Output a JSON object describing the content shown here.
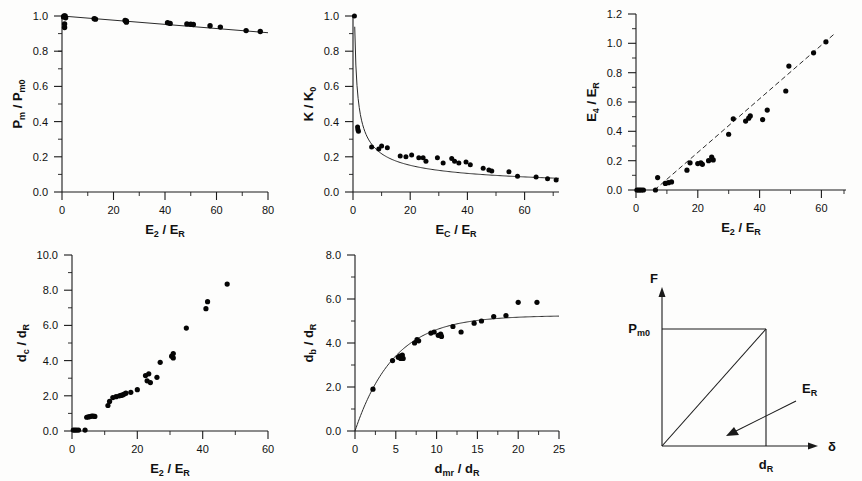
{
  "figure": {
    "title": "",
    "panel_count": 6,
    "background_color": "#fdfdfc",
    "ink_color": "#111111"
  },
  "chart_data": [
    {
      "id": "panel-a",
      "type": "scatter",
      "title": "",
      "xlabel": "E2 / ER",
      "ylabel": "Pm / Pm0",
      "xlabel_parts": {
        "main1": "E",
        "sub1": "2",
        "slash": " / ",
        "main2": "E",
        "sub2": "R"
      },
      "ylabel_parts": {
        "main1": "P",
        "sub1": "m",
        "slash": " / ",
        "main2": "P",
        "sub2": "m0"
      },
      "xlim": [
        0,
        80
      ],
      "ylim": [
        0.0,
        1.0
      ],
      "xticks": [
        0,
        20,
        40,
        60,
        80
      ],
      "xticklabels": [
        "0",
        "20",
        "40",
        "60",
        "80"
      ],
      "yticks": [
        0.0,
        0.2,
        0.4,
        0.6,
        0.8,
        1.0
      ],
      "yticklabels": [
        "0.0",
        "0.2",
        "0.4",
        "0.6",
        "0.8",
        "1.0"
      ],
      "grid": false,
      "legend": "none",
      "fit": {
        "kind": "line",
        "x": [
          0,
          80
        ],
        "y": [
          1.0,
          0.905
        ]
      },
      "points": [
        [
          0.6,
          0.995
        ],
        [
          0.8,
          1.0
        ],
        [
          1.2,
          1.0
        ],
        [
          1.4,
          0.99
        ],
        [
          1.0,
          0.955
        ],
        [
          1.0,
          0.935
        ],
        [
          12.5,
          0.985
        ],
        [
          13.0,
          0.982
        ],
        [
          24.5,
          0.975
        ],
        [
          25.0,
          0.972
        ],
        [
          25.0,
          0.965
        ],
        [
          41.0,
          0.962
        ],
        [
          42.0,
          0.958
        ],
        [
          48.5,
          0.955
        ],
        [
          50.0,
          0.953
        ],
        [
          51.0,
          0.952
        ],
        [
          57.5,
          0.945
        ],
        [
          61.5,
          0.937
        ],
        [
          71.5,
          0.917
        ],
        [
          77.0,
          0.912
        ]
      ]
    },
    {
      "id": "panel-b",
      "type": "scatter",
      "title": "",
      "xlabel": "EC / ER",
      "ylabel": "K / K0",
      "xlabel_parts": {
        "main1": "E",
        "sub1": "C",
        "slash": " / ",
        "main2": "E",
        "sub2": "R"
      },
      "ylabel_parts": {
        "main1": "K",
        "sub1": "",
        "slash": " / ",
        "main2": "K",
        "sub2": "0"
      },
      "xlim": [
        0,
        72
      ],
      "ylim": [
        0.0,
        1.0
      ],
      "xticks": [
        0,
        20,
        40,
        60
      ],
      "xticklabels": [
        "0",
        "20",
        "40",
        "60"
      ],
      "yticks": [
        0.0,
        0.2,
        0.4,
        0.6,
        0.8,
        1.0
      ],
      "yticklabels": [
        "0.0",
        "0.2",
        "0.4",
        "0.6",
        "0.8",
        "1.0"
      ],
      "grid": false,
      "legend": "none",
      "fit": {
        "kind": "power-decay",
        "amplitude": 0.72,
        "exponent": 0.52,
        "x0": 0.6,
        "xrange": [
          0.6,
          72
        ]
      },
      "points": [
        [
          0.5,
          1.0
        ],
        [
          1.6,
          0.37
        ],
        [
          1.7,
          0.355
        ],
        [
          1.9,
          0.345
        ],
        [
          6.5,
          0.255
        ],
        [
          9.0,
          0.245
        ],
        [
          10.0,
          0.262
        ],
        [
          12.0,
          0.252
        ],
        [
          16.5,
          0.205
        ],
        [
          18.5,
          0.2
        ],
        [
          20.5,
          0.21
        ],
        [
          23.0,
          0.195
        ],
        [
          24.5,
          0.195
        ],
        [
          25.5,
          0.175
        ],
        [
          29.5,
          0.195
        ],
        [
          31.5,
          0.165
        ],
        [
          34.5,
          0.19
        ],
        [
          35.5,
          0.175
        ],
        [
          37.0,
          0.165
        ],
        [
          39.5,
          0.17
        ],
        [
          41.0,
          0.155
        ],
        [
          45.5,
          0.135
        ],
        [
          47.5,
          0.125
        ],
        [
          48.5,
          0.12
        ],
        [
          54.5,
          0.115
        ],
        [
          57.5,
          0.09
        ],
        [
          64.0,
          0.085
        ],
        [
          68.0,
          0.075
        ],
        [
          71.0,
          0.068
        ]
      ]
    },
    {
      "id": "panel-c",
      "type": "scatter",
      "title": "",
      "xlabel": "E2 / ER",
      "ylabel": "E4 / ER",
      "xlabel_parts": {
        "main1": "E",
        "sub1": "2",
        "slash": " / ",
        "main2": "E",
        "sub2": "R"
      },
      "ylabel_parts": {
        "main1": "E",
        "sub1": "4",
        "slash": " / ",
        "main2": "E",
        "sub2": "R"
      },
      "xlim": [
        0,
        68
      ],
      "ylim": [
        0.0,
        1.2
      ],
      "xticks": [
        0,
        20,
        40,
        60
      ],
      "xticklabels": [
        "0",
        "20",
        "40",
        "60"
      ],
      "yticks": [
        0.0,
        0.2,
        0.4,
        0.6,
        0.8,
        1.0,
        1.2
      ],
      "yticklabels": [
        "0.0",
        "0.2",
        "0.4",
        "0.6",
        "0.8",
        "1.0",
        "1.2"
      ],
      "grid": false,
      "legend": "none",
      "fit": {
        "kind": "line",
        "x": [
          6.0,
          64.0
        ],
        "y": [
          0.0,
          1.06
        ]
      },
      "points": [
        [
          0.3,
          0.0
        ],
        [
          0.8,
          0.0
        ],
        [
          1.3,
          0.0
        ],
        [
          1.8,
          0.0
        ],
        [
          2.4,
          0.0
        ],
        [
          6.3,
          0.0
        ],
        [
          7.0,
          0.085
        ],
        [
          9.5,
          0.045
        ],
        [
          10.5,
          0.05
        ],
        [
          11.5,
          0.055
        ],
        [
          16.5,
          0.135
        ],
        [
          17.5,
          0.185
        ],
        [
          20.0,
          0.18
        ],
        [
          21.0,
          0.185
        ],
        [
          21.5,
          0.175
        ],
        [
          23.5,
          0.2
        ],
        [
          24.5,
          0.225
        ],
        [
          25.0,
          0.205
        ],
        [
          30.0,
          0.38
        ],
        [
          31.5,
          0.485
        ],
        [
          35.5,
          0.47
        ],
        [
          36.5,
          0.49
        ],
        [
          37.0,
          0.505
        ],
        [
          41.0,
          0.48
        ],
        [
          42.5,
          0.545
        ],
        [
          48.5,
          0.675
        ],
        [
          49.5,
          0.845
        ],
        [
          57.5,
          0.935
        ],
        [
          61.5,
          1.01
        ]
      ]
    },
    {
      "id": "panel-d",
      "type": "scatter",
      "title": "",
      "xlabel": "E2 / ER",
      "ylabel": "dc / dR",
      "xlabel_parts": {
        "main1": "E",
        "sub1": "2",
        "slash": " / ",
        "main2": "E",
        "sub2": "R"
      },
      "ylabel_parts": {
        "main1": "d",
        "sub1": "c",
        "slash": " / ",
        "main2": "d",
        "sub2": "R"
      },
      "xlim": [
        0,
        60
      ],
      "ylim": [
        0.0,
        10.0
      ],
      "xticks": [
        0,
        20,
        40,
        60
      ],
      "xticklabels": [
        "0",
        "20",
        "40",
        "60"
      ],
      "yticks": [
        0.0,
        2.0,
        4.0,
        6.0,
        8.0,
        10.0
      ],
      "yticklabels": [
        "0.0",
        "2.0",
        "4.0",
        "6.0",
        "8.0",
        "10.0"
      ],
      "grid": false,
      "legend": "none",
      "fit": {
        "kind": "none"
      },
      "points": [
        [
          0.4,
          0.05
        ],
        [
          0.9,
          0.05
        ],
        [
          1.4,
          0.05
        ],
        [
          2.0,
          0.05
        ],
        [
          4.0,
          0.05
        ],
        [
          4.5,
          0.78
        ],
        [
          5.0,
          0.8
        ],
        [
          5.5,
          0.82
        ],
        [
          6.0,
          0.85
        ],
        [
          6.5,
          0.85
        ],
        [
          7.0,
          0.83
        ],
        [
          11.0,
          1.45
        ],
        [
          11.5,
          1.68
        ],
        [
          12.5,
          1.9
        ],
        [
          13.5,
          1.95
        ],
        [
          14.5,
          2.0
        ],
        [
          15.0,
          2.02
        ],
        [
          15.5,
          2.05
        ],
        [
          16.0,
          2.1
        ],
        [
          16.5,
          2.15
        ],
        [
          18.0,
          2.2
        ],
        [
          20.0,
          2.35
        ],
        [
          22.5,
          3.15
        ],
        [
          23.5,
          3.25
        ],
        [
          23.0,
          2.85
        ],
        [
          24.0,
          2.75
        ],
        [
          26.0,
          3.05
        ],
        [
          27.0,
          3.9
        ],
        [
          30.5,
          4.25
        ],
        [
          31.0,
          4.4
        ],
        [
          31.0,
          4.15
        ],
        [
          35.0,
          5.85
        ],
        [
          41.0,
          6.95
        ],
        [
          41.5,
          7.35
        ],
        [
          47.5,
          8.35
        ]
      ]
    },
    {
      "id": "panel-e",
      "type": "scatter",
      "title": "",
      "xlabel": "dmr / dR",
      "ylabel": "db / dR",
      "xlabel_parts": {
        "main1": "d",
        "sub1": "mr",
        "slash": " / ",
        "main2": "d",
        "sub2": "R"
      },
      "ylabel_parts": {
        "main1": "d",
        "sub1": "b",
        "slash": " / ",
        "main2": "d",
        "sub2": "R"
      },
      "xlim": [
        0,
        25
      ],
      "ylim": [
        0.0,
        8.0
      ],
      "xticks": [
        0,
        5,
        10,
        15,
        20,
        25
      ],
      "xticklabels": [
        "0",
        "5",
        "10",
        "15",
        "20",
        "25"
      ],
      "yticks": [
        0.0,
        2.0,
        4.0,
        6.0,
        8.0
      ],
      "yticklabels": [
        "0.0",
        "2.0",
        "4.0",
        "6.0",
        "8.0"
      ],
      "grid": false,
      "legend": "none",
      "fit": {
        "kind": "saturating",
        "plateau": 5.25,
        "rate": 0.21
      },
      "points": [
        [
          2.2,
          1.9
        ],
        [
          4.6,
          3.2
        ],
        [
          5.3,
          3.35
        ],
        [
          5.5,
          3.4
        ],
        [
          5.6,
          3.3
        ],
        [
          5.8,
          3.45
        ],
        [
          5.9,
          3.3
        ],
        [
          7.3,
          4.0
        ],
        [
          7.6,
          4.15
        ],
        [
          7.8,
          4.1
        ],
        [
          9.3,
          4.45
        ],
        [
          9.7,
          4.5
        ],
        [
          10.2,
          4.35
        ],
        [
          10.5,
          4.4
        ],
        [
          10.6,
          4.3
        ],
        [
          12.0,
          4.75
        ],
        [
          13.0,
          4.5
        ],
        [
          14.6,
          4.9
        ],
        [
          15.5,
          5.0
        ],
        [
          17.0,
          5.2
        ],
        [
          18.5,
          5.25
        ],
        [
          20.0,
          5.85
        ],
        [
          22.3,
          5.85
        ]
      ]
    },
    {
      "id": "panel-f",
      "type": "schematic",
      "title": "",
      "xlabel": "δ",
      "ylabel": "F",
      "annotations": [
        {
          "name": "y-axis-label",
          "text": "F"
        },
        {
          "name": "x-axis-label",
          "text": "δ"
        },
        {
          "name": "force-level-label",
          "text": "Pm0",
          "parts": {
            "main": "P",
            "sub": "m0"
          }
        },
        {
          "name": "displacement-label",
          "text": "dR",
          "parts": {
            "main": "d",
            "sub": "R"
          }
        },
        {
          "name": "energy-area-label",
          "text": "ER",
          "parts": {
            "main": "E",
            "sub": "R"
          }
        }
      ],
      "description": "Triangular force-displacement schematic: line rises from origin to (dR, Pm0); arrow points to enclosed area labelled ER."
    }
  ]
}
